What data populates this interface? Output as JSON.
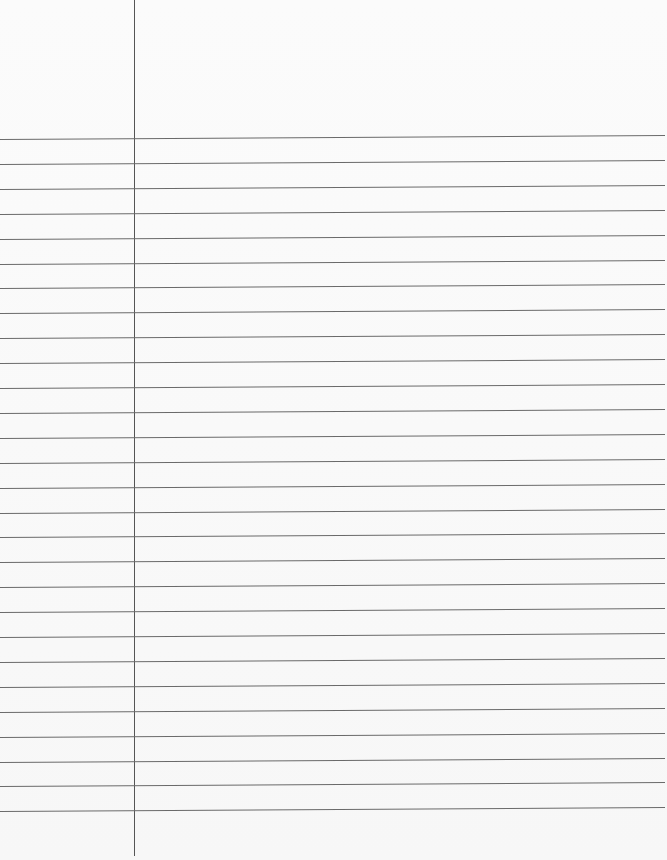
{
  "page": {
    "type": "lined notebook paper",
    "background_color": "#fafafa",
    "line_color": "#6a6a6a",
    "margin_line_color": "#555555",
    "margin_x": 134,
    "first_rule_y": 137,
    "rule_spacing": 24.9,
    "rule_count": 28
  }
}
